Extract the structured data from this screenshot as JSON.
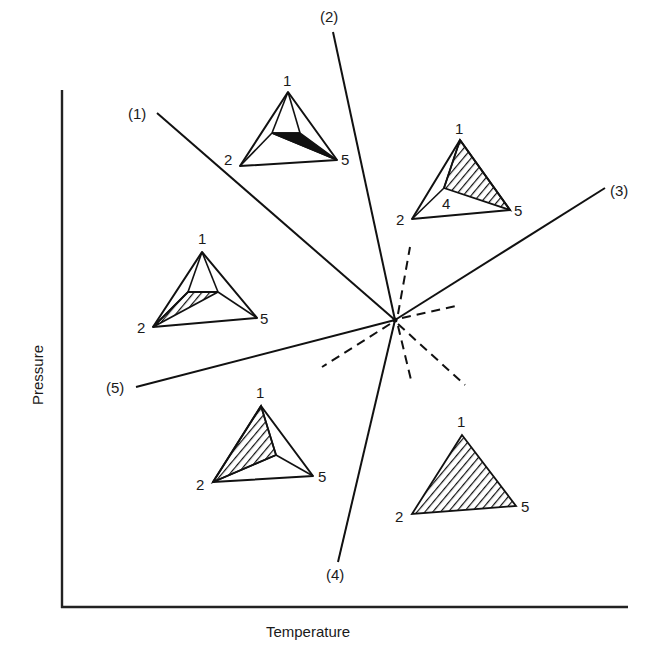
{
  "figure": {
    "axes": {
      "x_label": "Temperature",
      "y_label": "Pressure"
    },
    "invariant_point": {
      "x": 395,
      "y": 320
    },
    "univariant_lines": [
      {
        "id": "1",
        "label": "(1)",
        "end": [
          157,
          113
        ]
      },
      {
        "id": "2",
        "label": "(2)",
        "end": [
          333,
          32
        ]
      },
      {
        "id": "3",
        "label": "(3)",
        "end": [
          605,
          188
        ]
      },
      {
        "id": "4",
        "label": "(4)",
        "end": [
          338,
          562
        ]
      },
      {
        "id": "5",
        "label": "(5)",
        "end": [
          136,
          387
        ]
      }
    ],
    "metastable_extensions": [
      {
        "of": "1",
        "end": [
          465,
          385
        ]
      },
      {
        "of": "2",
        "end": [
          412,
          384
        ]
      },
      {
        "of": "3",
        "end": [
          322,
          367
        ]
      },
      {
        "of": "4",
        "end": [
          410,
          247
        ]
      },
      {
        "of": "5",
        "end": [
          456,
          306
        ]
      }
    ],
    "chemographic_diagrams": [
      {
        "id": "top-center",
        "vertex_labels": {
          "v1": "1",
          "v2": "2",
          "v5": "5"
        },
        "description": "Triangle 1-2-5 with interior tie-line quadrilateral; dark thin band near base"
      },
      {
        "id": "top-right",
        "vertex_labels": {
          "v1": "1",
          "v2": "2",
          "v4": "4",
          "v5": "5"
        },
        "description": "Triangle 1-2-5 with interior phase 4; hatched field 1-4-5"
      },
      {
        "id": "left-middle",
        "vertex_labels": {
          "v1": "1",
          "v2": "2",
          "v5": "5"
        },
        "description": "Triangle 1-2-5 with interior tie-lines; hatched field near 2"
      },
      {
        "id": "bottom-left",
        "vertex_labels": {
          "v1": "1",
          "v2": "2",
          "v5": "5"
        },
        "description": "Triangle 1-2-5 with interior point; hatched field 1-2-interior"
      },
      {
        "id": "bottom-right",
        "vertex_labels": {
          "v1": "1",
          "v2": "2",
          "v5": "5"
        },
        "description": "Fully hatched triangle 1-2-5"
      }
    ]
  }
}
